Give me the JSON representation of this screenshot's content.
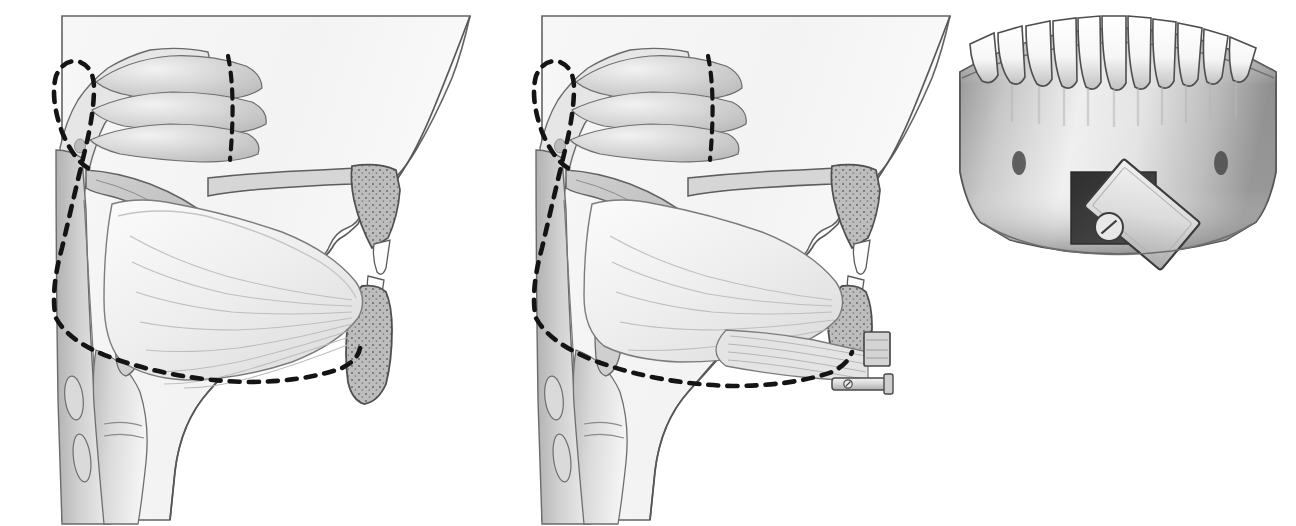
{
  "figure": {
    "background_color": "#ffffff",
    "panel_count": 3,
    "style": "grayscale medical line-and-tone illustration",
    "dimensions": {
      "width": 1296,
      "height": 526
    }
  },
  "colors": {
    "background": "#ffffff",
    "outline": "#4a4a4a",
    "outline_dark": "#3a3a3a",
    "soft_tissue_light": "#f2f2f2",
    "soft_tissue_mid": "#e2e2e2",
    "mucosa_gray": "#c9c9c9",
    "muscle_gray": "#d8d8d8",
    "bone_fill": "#b9b9b9",
    "bone_stipple": "#6f6f6f",
    "tooth_white": "#fbfbfb",
    "tooth_shadow": "#9a9a9a",
    "window_dark": "#3c3c3c",
    "plate_light": "#dcdcdc",
    "dashed_line": "#1a1a1a",
    "shadow_gray": "#8d8d8d"
  },
  "panels": [
    {
      "id": "panel-pre",
      "name": "preoperative-sagittal-view",
      "caption": "",
      "view": "mid-sagittal section of head and neck, facing right",
      "annotations": {
        "dashed_outline": "airway / surgical planning outline, looped anterior region and inferior arc beneath tongue",
        "dashed_vertical_tick": "short vertical dashed marker at nasal turbinate"
      },
      "structures": [
        "facial profile",
        "nasal cavity",
        "superior nasal turbinate",
        "middle nasal turbinate",
        "inferior nasal turbinate",
        "hard palate",
        "soft palate",
        "uvula",
        "tongue with radiating genioglossus fibers",
        "maxilla with trabecular bone",
        "upper incisor",
        "lower incisor",
        "mandible symphysis with trabecular bone",
        "oropharynx",
        "posterior pharyngeal wall",
        "epiglottis",
        "hyoid region",
        "larynx",
        "cervical vertebrae",
        "trachea"
      ]
    },
    {
      "id": "panel-post",
      "name": "postoperative-sagittal-view",
      "caption": "",
      "view": "mid-sagittal section of head and neck after genioglossus advancement",
      "annotations": {
        "dashed_outline": "airway / surgical planning outline, enlarged retroglossal space",
        "dashed_vertical_tick": "short vertical dashed marker at nasal turbinate"
      },
      "structures": [
        "facial profile",
        "nasal cavity",
        "nasal turbinates",
        "hard palate",
        "soft palate",
        "uvula",
        "tongue with radiating genioglossus fibers",
        "maxilla with trabecular bone",
        "upper incisor",
        "lower incisor",
        "advanced genial tubercle bone segment",
        "titanium fixation plate",
        "fixation screw",
        "genioglossus muscle pulled anteriorly",
        "oropharynx",
        "posterior pharyngeal wall",
        "epiglottis",
        "larynx",
        "cervical vertebrae",
        "trachea"
      ]
    },
    {
      "id": "panel-frontal",
      "name": "frontal-mandible-view",
      "caption": "",
      "view": "anterior view of mandible and lower dentition",
      "tooth_count": 11,
      "annotations": {
        "osteotomy_window": "dark rectangular bone window in anterior mandible",
        "bone_block": "rectangular genial tubercle block rotated approximately 45 degrees",
        "fixation_screw": "single slotted screw securing rotated bone block",
        "mental_foramina": "two small dark oval foramina, left and right of midline"
      },
      "structures": [
        "mandibular teeth",
        "alveolar ridge",
        "mandible body",
        "mental foramen left",
        "mental foramen right",
        "osteotomy window",
        "rotated bone block",
        "fixation screw",
        "inferior mandibular border"
      ]
    }
  ]
}
